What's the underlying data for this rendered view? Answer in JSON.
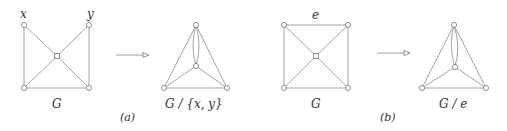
{
  "diagram": {
    "panels": [
      {
        "id": "a",
        "caption": "(a)",
        "before": {
          "label": "G",
          "vertex_labels": {
            "x": "x",
            "y": "y"
          },
          "nodes": [
            {
              "id": "x",
              "cx": 24,
              "cy": 25
            },
            {
              "id": "y",
              "cx": 89,
              "cy": 25
            },
            {
              "id": "c",
              "cx": 57,
              "cy": 56
            },
            {
              "id": "bl",
              "cx": 24,
              "cy": 88
            },
            {
              "id": "br",
              "cx": 89,
              "cy": 88
            }
          ],
          "edges": [
            [
              "x",
              "bl"
            ],
            [
              "x",
              "c"
            ],
            [
              "y",
              "c"
            ],
            [
              "y",
              "br"
            ],
            [
              "c",
              "bl"
            ],
            [
              "c",
              "br"
            ],
            [
              "bl",
              "br"
            ]
          ]
        },
        "after": {
          "label": "G / {x, y}",
          "nodes": [
            {
              "id": "xy",
              "cx": 196,
              "cy": 25
            },
            {
              "id": "c",
              "cx": 196,
              "cy": 66
            },
            {
              "id": "bl",
              "cx": 164,
              "cy": 88
            },
            {
              "id": "br",
              "cx": 227,
              "cy": 88
            }
          ],
          "edges": [
            [
              "xy",
              "bl"
            ],
            [
              "xy",
              "br"
            ],
            [
              "xy",
              "c",
              "double"
            ],
            [
              "c",
              "bl"
            ],
            [
              "c",
              "br"
            ],
            [
              "bl",
              "br"
            ]
          ]
        }
      },
      {
        "id": "b",
        "caption": "(b)",
        "before": {
          "label": "G",
          "edge_label": "e",
          "nodes": [
            {
              "id": "tl",
              "cx": 284,
              "cy": 25
            },
            {
              "id": "tr",
              "cx": 348,
              "cy": 25
            },
            {
              "id": "c",
              "cx": 316,
              "cy": 56
            },
            {
              "id": "bl",
              "cx": 284,
              "cy": 88
            },
            {
              "id": "br",
              "cx": 348,
              "cy": 88
            }
          ],
          "edges": [
            [
              "tl",
              "tr"
            ],
            [
              "tl",
              "bl"
            ],
            [
              "tl",
              "c"
            ],
            [
              "tr",
              "c"
            ],
            [
              "tr",
              "br"
            ],
            [
              "c",
              "bl"
            ],
            [
              "c",
              "br"
            ],
            [
              "bl",
              "br"
            ]
          ]
        },
        "after": {
          "label": "G / e",
          "nodes": [
            {
              "id": "e",
              "cx": 454,
              "cy": 25
            },
            {
              "id": "c",
              "cx": 455,
              "cy": 67
            },
            {
              "id": "bl",
              "cx": 422,
              "cy": 88
            },
            {
              "id": "br",
              "cx": 486,
              "cy": 88
            }
          ],
          "edges": [
            [
              "e",
              "bl"
            ],
            [
              "e",
              "br"
            ],
            [
              "e",
              "c",
              "double"
            ],
            [
              "c",
              "bl"
            ],
            [
              "c",
              "br"
            ],
            [
              "bl",
              "br"
            ]
          ]
        }
      }
    ],
    "arrows": [
      {
        "from_x": 116,
        "to_x": 148,
        "y": 55
      },
      {
        "from_x": 377,
        "to_x": 410,
        "y": 53
      }
    ]
  },
  "labels": {
    "g1_x": "x",
    "g1_y": "y",
    "g1_name": "G",
    "g2_name": "G / {x, y}",
    "caption_a": "(a)",
    "g3_e": "e",
    "g3_name": "G",
    "g4_name": "G / e",
    "caption_b": "(b)"
  }
}
